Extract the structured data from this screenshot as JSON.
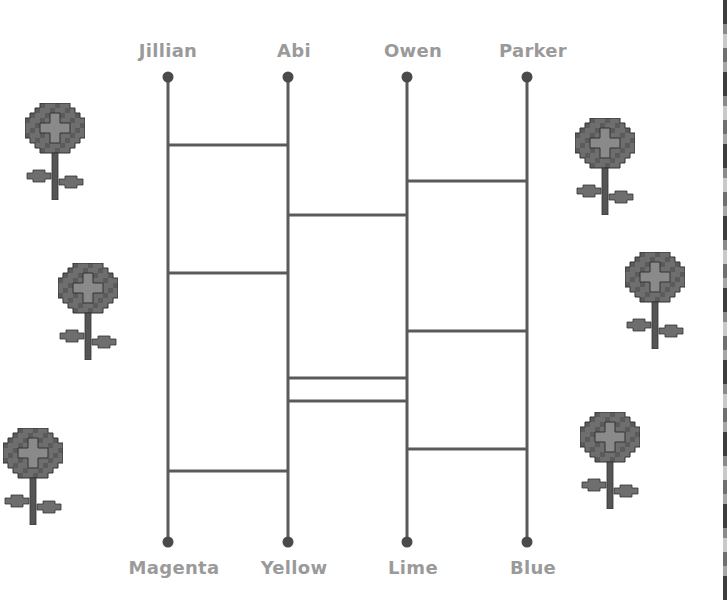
{
  "diagram": {
    "type": "ladder-puzzle",
    "colors": {
      "line": "#5a5a5a",
      "dot": "#4a4a4a",
      "label": "#9a9a9a",
      "flower_dark": "#5b5b5b",
      "flower_mid": "#6e6e6e",
      "flower_light": "#8a8a8a",
      "flower_outline": "#333333",
      "stem": "#555555"
    },
    "top_labels": [
      "Jillian",
      "Abi",
      "Owen",
      "Parker"
    ],
    "bottom_labels": [
      "Magenta",
      "Yellow",
      "Lime",
      "Blue"
    ],
    "columns_x": [
      168,
      288,
      407,
      527
    ],
    "rail_top_y": 77,
    "rail_bottom_y": 542,
    "rungs": [
      {
        "between": [
          "Jillian",
          "Abi"
        ],
        "from_col": 0,
        "y": 145
      },
      {
        "between": [
          "Owen",
          "Parker"
        ],
        "from_col": 2,
        "y": 181
      },
      {
        "between": [
          "Abi",
          "Owen"
        ],
        "from_col": 1,
        "y": 215
      },
      {
        "between": [
          "Jillian",
          "Abi"
        ],
        "from_col": 0,
        "y": 273
      },
      {
        "between": [
          "Owen",
          "Parker"
        ],
        "from_col": 2,
        "y": 331
      },
      {
        "between": [
          "Abi",
          "Owen"
        ],
        "from_col": 1,
        "y": 378
      },
      {
        "between": [
          "Abi",
          "Owen"
        ],
        "from_col": 1,
        "y": 401
      },
      {
        "between": [
          "Owen",
          "Parker"
        ],
        "from_col": 2,
        "y": 449
      },
      {
        "between": [
          "Jillian",
          "Abi"
        ],
        "from_col": 0,
        "y": 471
      }
    ],
    "flowers": [
      {
        "x": 25,
        "y": 103
      },
      {
        "x": 58,
        "y": 263
      },
      {
        "x": 3,
        "y": 428
      },
      {
        "x": 575,
        "y": 118
      },
      {
        "x": 625,
        "y": 252
      },
      {
        "x": 580,
        "y": 412
      }
    ]
  }
}
